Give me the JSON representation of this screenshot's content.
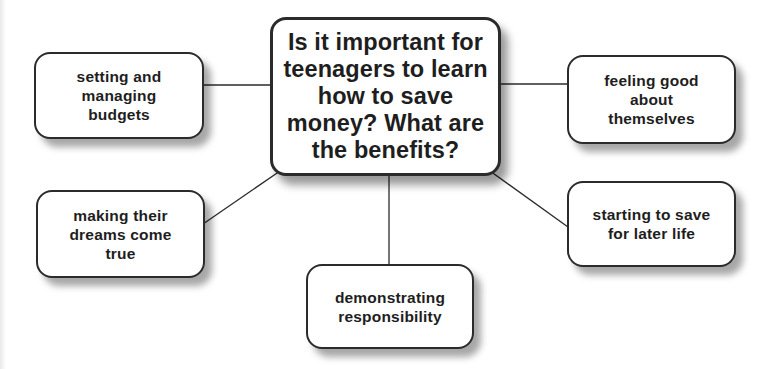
{
  "diagram": {
    "type": "mind-map",
    "central": {
      "text": "Is it important for\nteenagers to learn\nhow to save\nmoney? What are\nthe benefits?"
    },
    "branches": [
      {
        "id": "top-left",
        "text": "setting and\nmanaging\nbudgets"
      },
      {
        "id": "top-right",
        "text": "feeling good\nabout\nthemselves"
      },
      {
        "id": "bottom-left",
        "text": "making their\ndreams come\ntrue"
      },
      {
        "id": "bottom-right",
        "text": "starting to save\nfor later life"
      },
      {
        "id": "bottom-center",
        "text": "demonstrating\nresponsibility"
      }
    ],
    "colors": {
      "border": "#2b2b2b",
      "text": "#1e1e1e",
      "background": "#ffffff",
      "connector": "#2b2b2b"
    }
  }
}
